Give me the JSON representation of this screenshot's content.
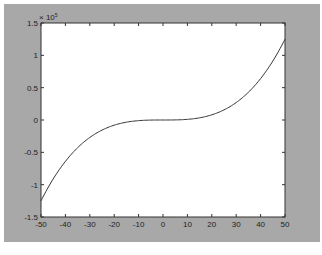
{
  "chart_data": {
    "type": "line",
    "title": "",
    "xlabel": "",
    "ylabel": "",
    "xlim": [
      -50,
      50
    ],
    "ylim": [
      -150000,
      150000
    ],
    "y_exponent_label": "x 10^5",
    "x_ticks": [
      -50,
      -40,
      -30,
      -20,
      -10,
      0,
      10,
      20,
      30,
      40,
      50
    ],
    "y_ticks": [
      -1.5,
      -1,
      -0.5,
      0,
      0.5,
      1,
      1.5
    ],
    "y_tick_scale": 100000,
    "grid": false,
    "series": [
      {
        "name": "y = x^3",
        "x": [
          -50,
          -40,
          -30,
          -20,
          -10,
          0,
          10,
          20,
          30,
          40,
          50
        ],
        "values": [
          -125000,
          -64000,
          -27000,
          -8000,
          -1000,
          0,
          1000,
          8000,
          27000,
          64000,
          125000
        ]
      }
    ]
  },
  "labels": {
    "exponent": "× 10",
    "exponent_power": "5",
    "x_ticks": [
      "-50",
      "-40",
      "-30",
      "-20",
      "-10",
      "0",
      "10",
      "20",
      "30",
      "40",
      "50"
    ],
    "y_ticks": [
      "1.5",
      "1",
      "0.5",
      "0",
      "-0.5",
      "-1",
      "-1.5"
    ]
  },
  "colors": {
    "figure_bg": "#a8a8a8",
    "axes_bg": "#ffffff",
    "line": "#333333"
  }
}
